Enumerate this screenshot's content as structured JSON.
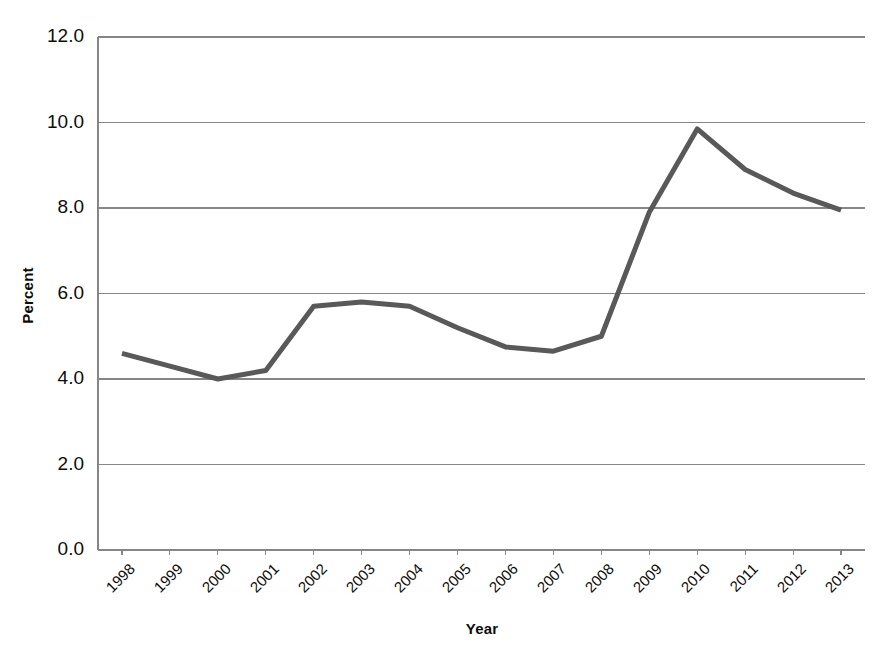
{
  "chart_data": {
    "type": "line",
    "title": "",
    "xlabel": "Year",
    "ylabel": "Percent",
    "categories": [
      "1998",
      "1999",
      "2000",
      "2001",
      "2002",
      "2003",
      "2004",
      "2005",
      "2006",
      "2007",
      "2008",
      "2009",
      "2010",
      "2011",
      "2012",
      "2013"
    ],
    "values": [
      4.6,
      4.3,
      4.0,
      4.2,
      5.7,
      5.8,
      5.7,
      5.2,
      4.75,
      4.65,
      5.0,
      7.9,
      9.85,
      8.9,
      8.35,
      7.95
    ],
    "series": [
      {
        "name": "Percent",
        "values": [
          4.6,
          4.3,
          4.0,
          4.2,
          5.7,
          5.8,
          5.7,
          5.2,
          4.75,
          4.65,
          5.0,
          7.9,
          9.85,
          8.9,
          8.35,
          7.95
        ]
      }
    ],
    "ylim": [
      0.0,
      12.0
    ],
    "ytick_values": [
      12.0,
      10.0,
      8.0,
      6.0,
      4.0,
      2.0,
      0.0
    ],
    "ytick_labels": [
      "12.0",
      "10.0",
      "8.0",
      "6.0",
      "4.0",
      "2.0",
      "0.0"
    ],
    "grid": true,
    "grid_axis": "y",
    "legend": false,
    "legend_position": "none",
    "xtick_rotation": -45,
    "line_color": "#595959",
    "line_width": 5,
    "grid_color": "#868686",
    "axis_color": "#868686",
    "background_color": "#ffffff",
    "markers": false
  },
  "axes": {
    "y_title": "Percent",
    "x_title": "Year"
  }
}
